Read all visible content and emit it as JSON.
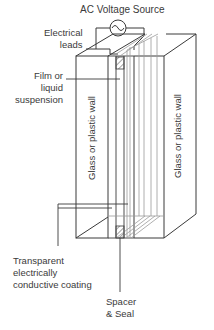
{
  "title": "AC Voltage Source",
  "labels": {
    "leads_line1": "Electrical",
    "leads_line2": "leads",
    "film_line1": "Film or",
    "film_line2": "liquid",
    "film_line3": "suspension",
    "wall_left": "Glass or plastic wall",
    "wall_right": "Glass or plastic wall",
    "coating_line1": "Transparent",
    "coating_line2": "electrically",
    "coating_line3": "conductive coating",
    "spacer_line1": "Spacer",
    "spacer_line2": "& Seal"
  },
  "colors": {
    "line": "#3a3a3a",
    "light_line": "#9a9a9a",
    "hatch": "#8a8a8a"
  }
}
